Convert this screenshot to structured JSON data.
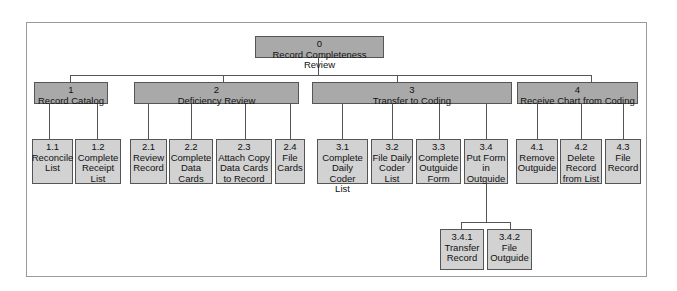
{
  "diagram": {
    "root": {
      "id": "0",
      "label": "Record Completeness Review"
    },
    "level1": [
      {
        "id": "1",
        "label": "Record Catalog"
      },
      {
        "id": "2",
        "label": "Deficiency Review"
      },
      {
        "id": "3",
        "label": "Transfer to Coding"
      },
      {
        "id": "4",
        "label": "Receive Chart from Coding"
      }
    ],
    "leaves": [
      {
        "id": "1.1",
        "label": "Reconcile\nList"
      },
      {
        "id": "1.2",
        "label": "Complete\nReceipt\nList"
      },
      {
        "id": "2.1",
        "label": "Review\nRecord"
      },
      {
        "id": "2.2",
        "label": "Complete\nData\nCards"
      },
      {
        "id": "2.3",
        "label": "Attach Copy\nData Cards\nto Record"
      },
      {
        "id": "2.4",
        "label": "File\nCards"
      },
      {
        "id": "3.1",
        "label": "Complete\nDaily Coder\nList"
      },
      {
        "id": "3.2",
        "label": "File Daily\nCoder\nList"
      },
      {
        "id": "3.3",
        "label": "Complete\nOutguide\nForm"
      },
      {
        "id": "3.4",
        "label": "Put Form\nin\nOutguide"
      },
      {
        "id": "4.1",
        "label": "Remove\nOutguide"
      },
      {
        "id": "4.2",
        "label": "Delete\nRecord\nfrom List"
      },
      {
        "id": "4.3",
        "label": "File\nRecord"
      }
    ],
    "level3": [
      {
        "id": "3.4.1",
        "label": "Transfer\nRecord"
      },
      {
        "id": "3.4.2",
        "label": "File\nOutguide"
      }
    ]
  }
}
